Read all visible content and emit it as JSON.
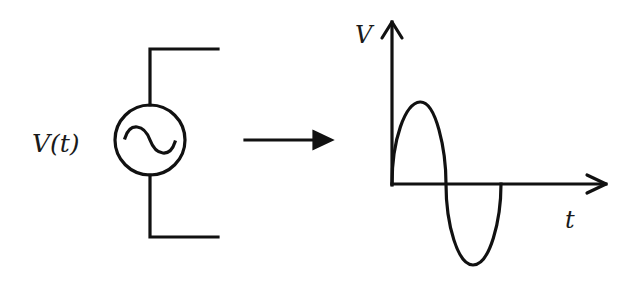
{
  "diagram": {
    "source": {
      "label": "V(t)",
      "symbol": "ac-voltage-source",
      "center": [
        150,
        140
      ],
      "radius": 35
    },
    "transition_arrow": {
      "direction": "right"
    },
    "graph": {
      "y_axis_label": "V",
      "x_axis_label": "t",
      "waveform": "sine",
      "cycles": 1
    },
    "colors": {
      "stroke": "#111111",
      "background": "#ffffff"
    }
  }
}
